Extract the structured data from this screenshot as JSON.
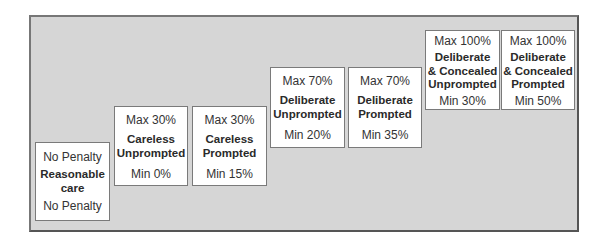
{
  "diagram": {
    "type": "staircase",
    "colors": {
      "frame_background": "#d6d6d6",
      "frame_border": "#555555",
      "box_background": "#ffffff",
      "box_border": "#7a7a7a",
      "text": "#333333"
    },
    "steps": [
      {
        "top": "No Penalty",
        "title": "Reasonable care",
        "bottom": "No Penalty"
      },
      {
        "top": "Max 30%",
        "title": "Careless Unprompted",
        "bottom": "Min 0%"
      },
      {
        "top": "Max 30%",
        "title": "Careless Prompted",
        "bottom": "Min 15%"
      },
      {
        "top": "Max 70%",
        "title": "Deliberate Unprompted",
        "bottom": "Min 20%"
      },
      {
        "top": "Max 70%",
        "title": "Deliberate Prompted",
        "bottom": "Min 35%"
      },
      {
        "top": "Max 100%",
        "title": "Deliberate & Concealed Unprompted",
        "bottom": "Min 30%"
      },
      {
        "top": "Max 100%",
        "title": "Deliberate & Concealed Prompted",
        "bottom": "Min 50%"
      }
    ]
  },
  "titles": {
    "t0a": "Reasonable",
    "t0b": "care",
    "t1a": "Careless",
    "t1b": "Unprompted",
    "t2a": "Careless",
    "t2b": "Prompted",
    "t3a": "Deliberate",
    "t3b": "Unprompted",
    "t4a": "Deliberate",
    "t4b": "Prompted",
    "t5a": "Deliberate",
    "t5b": "& Concealed",
    "t5c": "Unprompted",
    "t6a": "Deliberate",
    "t6b": "& Concealed",
    "t6c": "Prompted"
  }
}
